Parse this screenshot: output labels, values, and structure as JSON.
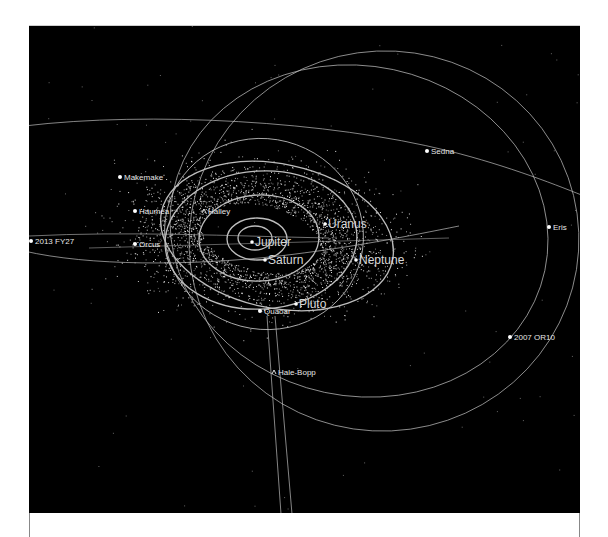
{
  "view": {
    "title": "Outer Solar System orbit view",
    "background": "#000000",
    "orbit_color": "#bdbdbd",
    "label_color": "#e6e6e6"
  },
  "planets": [
    {
      "name": "Jupiter",
      "x": 223,
      "y": 216
    },
    {
      "name": "Saturn",
      "x": 236,
      "y": 234
    },
    {
      "name": "Uranus",
      "x": 296,
      "y": 198
    },
    {
      "name": "Neptune",
      "x": 327,
      "y": 234
    },
    {
      "name": "Pluto",
      "x": 267,
      "y": 278
    }
  ],
  "dwarf_objects": [
    {
      "name": "Makemake",
      "x": 91,
      "y": 151
    },
    {
      "name": "Haumea",
      "x": 106,
      "y": 185
    },
    {
      "name": "Orcus",
      "x": 106,
      "y": 218
    },
    {
      "name": "2013 FY27",
      "x": 2,
      "y": 215
    },
    {
      "name": "Sedna",
      "x": 398,
      "y": 125
    },
    {
      "name": "Eris",
      "x": 520,
      "y": 201
    },
    {
      "name": "2007 OR10",
      "x": 481,
      "y": 311
    },
    {
      "name": "Quaoar",
      "x": 231,
      "y": 285
    }
  ],
  "comets": [
    {
      "name": "Halley",
      "x": 175,
      "y": 185
    },
    {
      "name": "Hale-Bopp",
      "x": 245,
      "y": 346
    }
  ]
}
